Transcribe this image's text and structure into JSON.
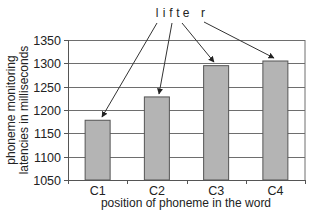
{
  "chart_data": {
    "type": "bar",
    "title": "",
    "annotation": {
      "word": "lifter",
      "letters": [
        "l",
        "i",
        "f",
        "t",
        "e",
        "r"
      ],
      "arrows": [
        {
          "from_letter": "l",
          "to_category": "C1"
        },
        {
          "from_letter": "i",
          "to_category": "C2"
        },
        {
          "from_letter": "t",
          "to_category": "C3"
        },
        {
          "from_letter": "r",
          "to_category": "C4"
        }
      ]
    },
    "categories": [
      "C1",
      "C2",
      "C3",
      "C4"
    ],
    "values": [
      1178,
      1228,
      1295,
      1305
    ],
    "xlabel": "position of phoneme in the word",
    "ylabel": [
      "phoneme monitoring",
      "latencies in milliseconds"
    ],
    "ylim": [
      1050,
      1350
    ],
    "yticks": [
      1050,
      1100,
      1150,
      1200,
      1250,
      1300,
      1350
    ],
    "grid": true,
    "legend": null,
    "colors": {
      "bar_fill": "#b4b4b4",
      "bar_stroke": "#555555",
      "grid": "#6e6e6e",
      "axis": "#555555",
      "arrow": "#333333"
    }
  }
}
